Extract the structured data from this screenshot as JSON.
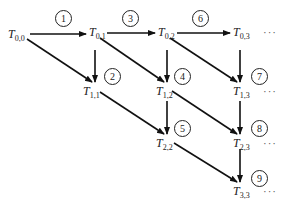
{
  "diagram": {
    "type": "computation-order-grid",
    "nodes": [
      {
        "id": "T00",
        "base": "T",
        "sub": "0,0",
        "x": 8,
        "y": 28
      },
      {
        "id": "T01",
        "base": "T",
        "sub": "0,1",
        "x": 89,
        "y": 26
      },
      {
        "id": "T02",
        "base": "T",
        "sub": "0,2",
        "x": 158,
        "y": 26
      },
      {
        "id": "T03",
        "base": "T",
        "sub": "0,3",
        "x": 233,
        "y": 26
      },
      {
        "id": "T11",
        "base": "T",
        "sub": "1,1",
        "x": 83,
        "y": 85
      },
      {
        "id": "T12",
        "base": "T",
        "sub": "1,2",
        "x": 156,
        "y": 85
      },
      {
        "id": "T13",
        "base": "T",
        "sub": "1,3",
        "x": 233,
        "y": 85
      },
      {
        "id": "T22",
        "base": "T",
        "sub": "2,2",
        "x": 156,
        "y": 137
      },
      {
        "id": "T23",
        "base": "T",
        "sub": "2,3",
        "x": 233,
        "y": 137
      },
      {
        "id": "T33",
        "base": "T",
        "sub": "3,3",
        "x": 233,
        "y": 185
      }
    ],
    "steps": [
      {
        "label": "1",
        "x": 55,
        "y": 10
      },
      {
        "label": "2",
        "x": 104,
        "y": 68
      },
      {
        "label": "3",
        "x": 122,
        "y": 10
      },
      {
        "label": "4",
        "x": 174,
        "y": 68
      },
      {
        "label": "5",
        "x": 174,
        "y": 120
      },
      {
        "label": "6",
        "x": 192,
        "y": 10
      },
      {
        "label": "7",
        "x": 251,
        "y": 68
      },
      {
        "label": "8",
        "x": 251,
        "y": 120
      },
      {
        "label": "9",
        "x": 251,
        "y": 170
      }
    ],
    "ellipses": [
      {
        "text": "···",
        "x": 263,
        "y": 26
      },
      {
        "text": "···",
        "x": 263,
        "y": 85
      },
      {
        "text": "···",
        "x": 263,
        "y": 137
      },
      {
        "text": "···",
        "x": 263,
        "y": 185
      }
    ]
  }
}
